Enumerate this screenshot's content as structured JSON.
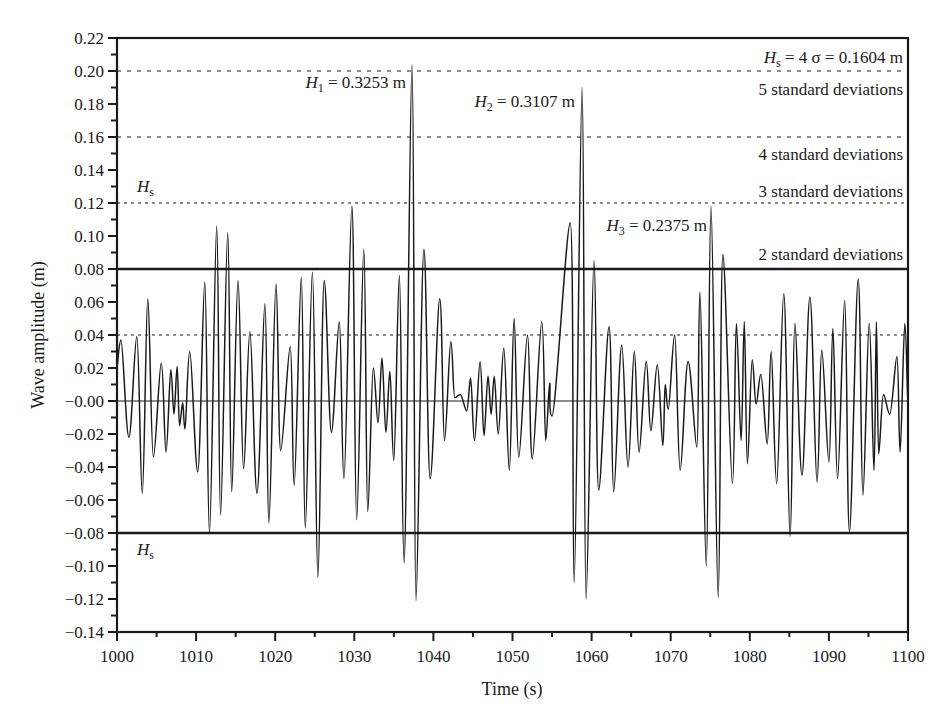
{
  "chart_data": {
    "type": "line",
    "title": "",
    "xlabel": "Time (s)",
    "ylabel": "Wave amplitude (m)",
    "xlim": [
      1000,
      1100
    ],
    "ylim": [
      -0.14,
      0.22
    ],
    "x_ticks": [
      1000,
      1010,
      1020,
      1030,
      1040,
      1050,
      1060,
      1070,
      1080,
      1090,
      1100
    ],
    "x_tick_labels": [
      "1000",
      "1010",
      "1020",
      "1030",
      "1040",
      "1050",
      "1060",
      "1070",
      "1080",
      "1090",
      "1100"
    ],
    "y_ticks": [
      0.22,
      0.2,
      0.18,
      0.16,
      0.14,
      0.12,
      0.1,
      0.08,
      0.06,
      0.04,
      0.02,
      0.0,
      -0.02,
      -0.04,
      -0.06,
      -0.08,
      -0.1,
      -0.12,
      -0.14
    ],
    "y_tick_labels": [
      "0.22",
      "0.20",
      "0.18",
      "0.16",
      "0.14",
      "0.12",
      "0.10",
      "0.08",
      "0.06",
      "0.04",
      "0.02",
      "−0.00",
      "−0.02",
      "−0.04",
      "−0.06",
      "−0.08",
      "−0.10",
      "−0.12",
      "−0.14"
    ],
    "grid": false,
    "legend": null,
    "series": [
      {
        "name": "Wave amplitude",
        "color": "#1a1a1a",
        "x": [
          1000.0,
          1000.5,
          1001.5,
          1002.5,
          1003.2,
          1003.9,
          1004.6,
          1005.6,
          1006.2,
          1006.8,
          1007.2,
          1007.6,
          1007.9,
          1008.3,
          1008.6,
          1009.2,
          1010.2,
          1011.1,
          1011.7,
          1012.6,
          1013.1,
          1014.0,
          1014.5,
          1015.3,
          1016.0,
          1016.8,
          1017.7,
          1018.7,
          1019.2,
          1020.1,
          1020.7,
          1021.9,
          1022.4,
          1023.3,
          1023.8,
          1024.7,
          1025.4,
          1026.2,
          1027.1,
          1028.1,
          1028.7,
          1029.7,
          1030.3,
          1031.2,
          1031.7,
          1032.4,
          1033.0,
          1033.5,
          1034.0,
          1034.5,
          1035.0,
          1035.7,
          1036.3,
          1037.3,
          1037.8,
          1038.8,
          1039.6,
          1040.8,
          1041.4,
          1042.2,
          1042.7,
          1043.4,
          1044.2,
          1044.7,
          1045.2,
          1045.9,
          1046.4,
          1046.9,
          1047.3,
          1047.7,
          1048.2,
          1048.9,
          1049.6,
          1050.2,
          1050.8,
          1051.9,
          1052.5,
          1053.7,
          1054.2,
          1054.7,
          1055.0,
          1057.3,
          1057.8,
          1058.8,
          1059.3,
          1060.3,
          1060.9,
          1062.2,
          1062.8,
          1063.8,
          1064.6,
          1065.4,
          1066.0,
          1066.9,
          1067.5,
          1068.3,
          1069.0,
          1069.3,
          1069.7,
          1070.5,
          1071.2,
          1072.2,
          1073.3,
          1073.7,
          1074.5,
          1075.1,
          1076.0,
          1076.6,
          1077.8,
          1078.3,
          1078.9,
          1079.3,
          1079.7,
          1080.3,
          1080.8,
          1081.4,
          1082.2,
          1082.7,
          1083.4,
          1084.3,
          1085.1,
          1085.7,
          1086.6,
          1087.6,
          1088.5,
          1089.1,
          1090.0,
          1090.5,
          1091.1,
          1092.0,
          1092.6,
          1093.7,
          1094.3,
          1095.1,
          1095.7,
          1096.0,
          1096.3,
          1096.9,
          1097.7,
          1098.6,
          1099.0,
          1099.6,
          1100.0
        ],
        "y": [
          0.02,
          0.037,
          -0.022,
          0.039,
          -0.056,
          0.062,
          -0.034,
          0.023,
          -0.031,
          0.019,
          -0.008,
          0.021,
          -0.015,
          -0.001,
          -0.017,
          0.03,
          -0.043,
          0.072,
          -0.08,
          0.106,
          -0.069,
          0.102,
          -0.055,
          0.073,
          -0.041,
          0.042,
          -0.056,
          0.059,
          -0.074,
          0.071,
          -0.03,
          0.033,
          -0.051,
          0.075,
          -0.077,
          0.078,
          -0.107,
          0.073,
          -0.019,
          0.048,
          -0.047,
          0.118,
          -0.072,
          0.092,
          -0.067,
          0.02,
          -0.013,
          0.026,
          -0.019,
          0.018,
          -0.036,
          0.076,
          -0.098,
          0.204,
          -0.121,
          0.092,
          -0.047,
          0.062,
          -0.024,
          0.036,
          0.002,
          0.004,
          -0.006,
          0.014,
          -0.024,
          0.024,
          -0.021,
          0.015,
          -0.008,
          0.015,
          -0.02,
          0.032,
          -0.042,
          0.05,
          -0.034,
          0.04,
          -0.035,
          0.048,
          -0.024,
          0.011,
          -0.009,
          0.108,
          -0.11,
          0.19,
          -0.12,
          0.085,
          -0.054,
          0.045,
          -0.055,
          0.034,
          -0.04,
          0.03,
          -0.031,
          0.024,
          -0.018,
          0.022,
          -0.027,
          0.01,
          -0.005,
          0.04,
          -0.042,
          0.024,
          -0.028,
          0.066,
          -0.1,
          0.118,
          -0.119,
          0.089,
          -0.05,
          0.047,
          -0.024,
          0.048,
          -0.038,
          0.025,
          -0.002,
          0.016,
          -0.026,
          0.03,
          -0.05,
          0.065,
          -0.082,
          0.047,
          -0.045,
          0.063,
          -0.049,
          0.031,
          -0.037,
          0.044,
          -0.047,
          0.061,
          -0.079,
          0.074,
          -0.057,
          0.047,
          -0.042,
          0.048,
          -0.032,
          0.004,
          -0.008,
          0.027,
          -0.031,
          0.047,
          -0.003
        ]
      }
    ],
    "reference_lines": [
      {
        "name": "plus-2-sigma",
        "value": 0.08,
        "style": "solid",
        "width": 2.6,
        "label": "2 standard deviations"
      },
      {
        "name": "minus-2-sigma",
        "value": -0.08,
        "style": "solid",
        "width": 2.6,
        "label": ""
      },
      {
        "name": "plus-1-sigma",
        "value": 0.04,
        "style": "dotted",
        "width": 1.2,
        "label": ""
      },
      {
        "name": "plus-3-sigma",
        "value": 0.12,
        "style": "dotted",
        "width": 1.2,
        "label": "3 standard deviations"
      },
      {
        "name": "plus-4-sigma",
        "value": 0.16,
        "style": "dashed",
        "width": 1.2,
        "label": "4 standard deviations"
      },
      {
        "name": "plus-5-sigma",
        "value": 0.2,
        "style": "dashed",
        "width": 1.2,
        "label": "5 standard deviations"
      },
      {
        "name": "zero",
        "value": 0.0,
        "style": "solid",
        "width": 1.0,
        "label": ""
      }
    ],
    "annotations": [
      {
        "name": "hs-definition",
        "text_main": "H",
        "text_sub": "s",
        "text_rest": " = 4 σ = 0.1604 m"
      },
      {
        "name": "h1-label",
        "text_main": "H",
        "text_sub": "1",
        "text_rest": " = 0.3253 m",
        "x": 1037.3,
        "y": 0.204
      },
      {
        "name": "h2-label",
        "text_main": "H",
        "text_sub": "2",
        "text_rest": " = 0.3107 m",
        "x": 1058.8,
        "y": 0.19
      },
      {
        "name": "h3-label",
        "text_main": "H",
        "text_sub": "3",
        "text_rest": " = 0.2375 m",
        "x": 1075.1,
        "y": 0.118
      },
      {
        "name": "hs-upper-label",
        "text_main": "H",
        "text_sub": "s",
        "text_rest": ""
      },
      {
        "name": "hs-lower-label",
        "text_main": "H",
        "text_sub": "s",
        "text_rest": ""
      }
    ],
    "std_labels": {
      "five": "5 standard deviations",
      "four": "4 standard deviations",
      "three": "3 standard deviations",
      "two": "2 standard deviations"
    }
  }
}
